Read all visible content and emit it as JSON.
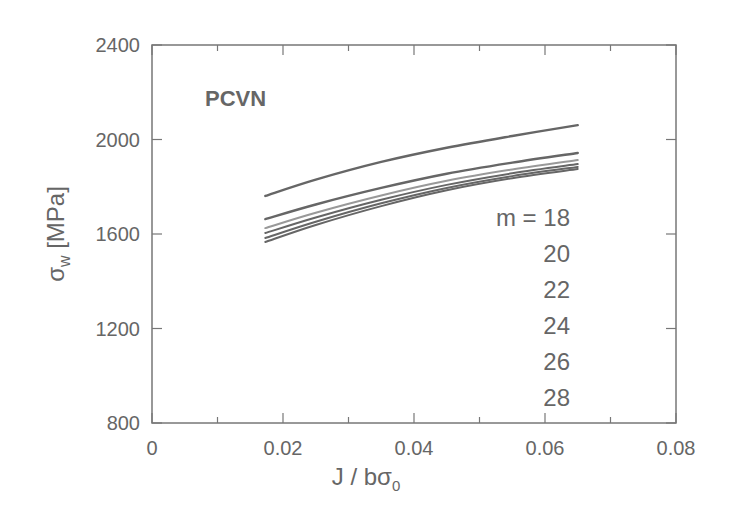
{
  "chart_data": {
    "type": "line",
    "title": "PCVN",
    "xlabel": "J / bσ0",
    "ylabel": "σw [MPa]",
    "xlim": [
      0,
      0.08
    ],
    "ylim": [
      800,
      2400
    ],
    "x_ticks": [
      "0",
      "0.02",
      "0.04",
      "0.06",
      "0.08"
    ],
    "y_ticks": [
      "800",
      "1200",
      "1600",
      "2000",
      "2400"
    ],
    "grid": false,
    "legend_annotation": {
      "prefix": "m = ",
      "labels": [
        "18",
        "20",
        "22",
        "24",
        "26",
        "28"
      ]
    },
    "x": [
      0.0173,
      0.025,
      0.035,
      0.045,
      0.055,
      0.065
    ],
    "series": [
      {
        "name": "m = 18",
        "values": [
          1761,
          1830,
          1905,
          1965,
          2015,
          2061
        ]
      },
      {
        "name": "m = 20",
        "values": [
          1663,
          1725,
          1795,
          1855,
          1902,
          1943
        ]
      },
      {
        "name": "m = 22",
        "values": [
          1625,
          1690,
          1763,
          1825,
          1873,
          1913
        ]
      },
      {
        "name": "m = 24",
        "values": [
          1604,
          1670,
          1745,
          1808,
          1857,
          1896
        ]
      },
      {
        "name": "m = 26",
        "values": [
          1583,
          1652,
          1730,
          1795,
          1845,
          1884
        ]
      },
      {
        "name": "m = 28",
        "values": [
          1566,
          1638,
          1718,
          1785,
          1836,
          1875
        ]
      }
    ]
  },
  "labels": {
    "title": "PCVN",
    "xlabel_main": "J / bσ",
    "xlabel_sub": "0",
    "ylabel_sigma": "σ",
    "ylabel_sub": "w",
    "ylabel_unit": " [MPa]",
    "m_prefix": "m = "
  },
  "style": {
    "axis_color": "#777777",
    "line_color": "#666666",
    "text_color": "#666666"
  }
}
